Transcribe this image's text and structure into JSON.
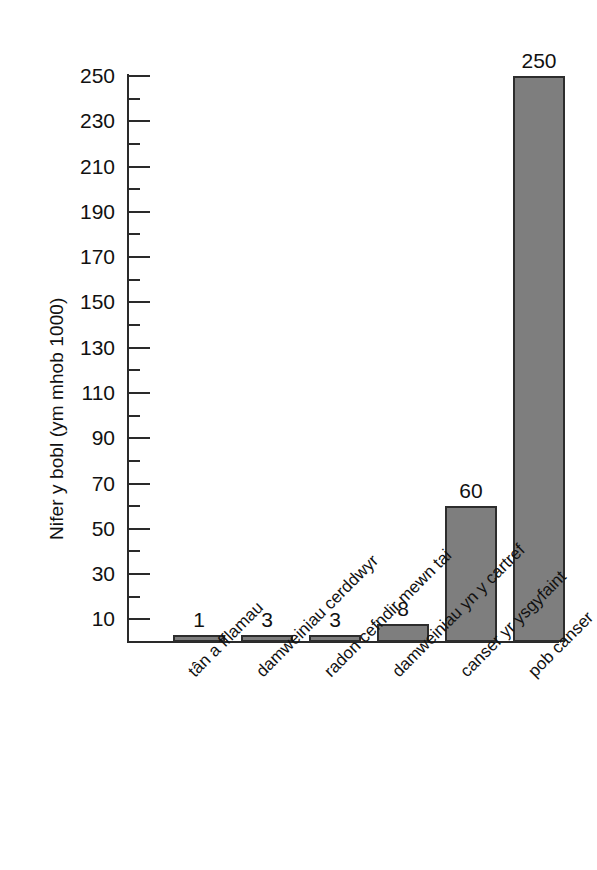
{
  "chart_data": {
    "type": "bar",
    "title": "",
    "xlabel": "",
    "ylabel": "Nifer y bobl (ym mhob 1000)",
    "ylim": [
      0,
      255
    ],
    "ytick_step": 20,
    "yminor_step": 10,
    "grid": false,
    "legend": null,
    "bar_color": "#7e7e7e",
    "bar_border_color": "#2d2d2d",
    "axis_color": "#2a2a2a",
    "categories": [
      "tân a fflamau",
      "damweiniau cerddwyr",
      "radon cefndir mewn tai",
      "damweiniau yn y cartref",
      "canser yr ysgyfaint",
      "pob canser"
    ],
    "values": [
      1,
      3,
      3,
      8,
      60,
      250
    ],
    "value_labels": [
      "1",
      "3",
      "3",
      "8",
      "60",
      "250"
    ],
    "yticks": [
      {
        "value": 250,
        "label": "250"
      },
      {
        "value": 230,
        "label": "230"
      },
      {
        "value": 210,
        "label": "210"
      },
      {
        "value": 190,
        "label": "190"
      },
      {
        "value": 170,
        "label": "170"
      },
      {
        "value": 150,
        "label": "150"
      },
      {
        "value": 130,
        "label": "130"
      },
      {
        "value": 110,
        "label": "110"
      },
      {
        "value": 90,
        "label": "90"
      },
      {
        "value": 70,
        "label": "70"
      },
      {
        "value": 50,
        "label": "50"
      },
      {
        "value": 30,
        "label": "30"
      },
      {
        "value": 10,
        "label": "10"
      }
    ],
    "yminor_ticks": [
      240,
      220,
      200,
      180,
      160,
      140,
      120,
      100,
      80,
      60,
      40,
      20
    ]
  },
  "axis": {
    "y_title": "Nifer y bobl (ym mhob 1000)"
  }
}
